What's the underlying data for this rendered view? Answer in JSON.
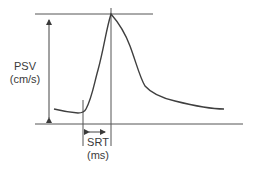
{
  "diagram": {
    "title": "",
    "colors": {
      "line": "#4a4a4a",
      "text": "#3a3a3a",
      "background": "#ffffff"
    },
    "labels": {
      "psv": "PSV",
      "psv_unit": "(cm/s)",
      "srt": "SRT",
      "srt_unit": "(ms)"
    },
    "annotations": [
      {
        "name": "PSV",
        "meaning": "peak systolic velocity",
        "unit": "cm/s",
        "marker": "vertical double arrow from baseline to peak"
      },
      {
        "name": "SRT",
        "meaning": "systolic rise time",
        "unit": "ms",
        "marker": "horizontal double arrow from waveform onset to peak"
      }
    ]
  }
}
